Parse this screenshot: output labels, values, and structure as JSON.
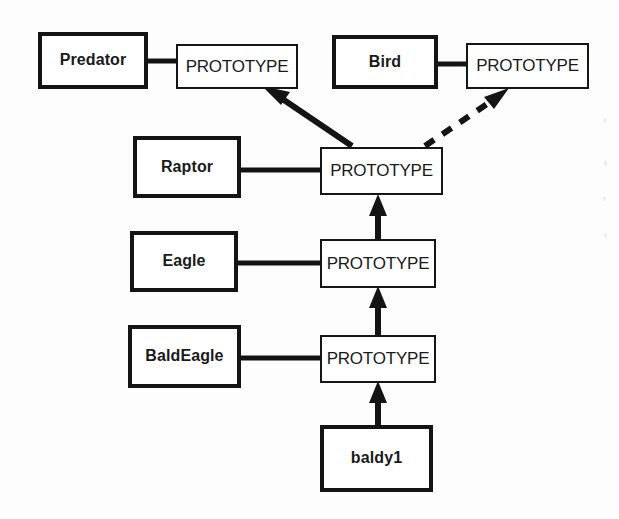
{
  "diagram": {
    "kind": "prototype-delegation-diagram",
    "title": "",
    "background_color": "#fdfdfd",
    "stroke_color": "#141414",
    "nodes": [
      {
        "id": "predator",
        "label": "Predator",
        "type": "class",
        "x": 38,
        "y": 32,
        "w": 110,
        "h": 57
      },
      {
        "id": "predator_prototype",
        "label": "PROTOTYPE",
        "type": "prototype",
        "x": 176,
        "y": 44,
        "w": 122,
        "h": 45
      },
      {
        "id": "bird",
        "label": "Bird",
        "type": "class",
        "x": 332,
        "y": 35,
        "w": 106,
        "h": 54
      },
      {
        "id": "bird_prototype",
        "label": "PROTOTYPE",
        "type": "prototype",
        "x": 466,
        "y": 43,
        "w": 123,
        "h": 46
      },
      {
        "id": "raptor",
        "label": "Raptor",
        "type": "class",
        "x": 133,
        "y": 136,
        "w": 108,
        "h": 62
      },
      {
        "id": "raptor_prototype",
        "label": "PROTOTYPE",
        "type": "prototype",
        "x": 320,
        "y": 147,
        "w": 123,
        "h": 48
      },
      {
        "id": "eagle",
        "label": "Eagle",
        "type": "class",
        "x": 130,
        "y": 231,
        "w": 108,
        "h": 61
      },
      {
        "id": "eagle_prototype",
        "label": "PROTOTYPE",
        "type": "prototype",
        "x": 320,
        "y": 239,
        "w": 116,
        "h": 49
      },
      {
        "id": "baldeagle",
        "label": "BaldEagle",
        "type": "class",
        "x": 128,
        "y": 325,
        "w": 113,
        "h": 63
      },
      {
        "id": "baldeagle_prototype",
        "label": "PROTOTYPE",
        "type": "prototype",
        "x": 320,
        "y": 335,
        "w": 116,
        "h": 48
      },
      {
        "id": "baldy1",
        "label": "baldy1",
        "type": "class",
        "x": 320,
        "y": 425,
        "w": 113,
        "h": 67
      }
    ],
    "edges": [
      {
        "id": "predator-to-prototype",
        "from": "predator",
        "to": "predator_prototype",
        "style": "solid",
        "arrow": "none",
        "kind": "link"
      },
      {
        "id": "bird-to-prototype",
        "from": "bird",
        "to": "bird_prototype",
        "style": "solid",
        "arrow": "none",
        "kind": "link"
      },
      {
        "id": "raptor-to-prototype",
        "from": "raptor",
        "to": "raptor_prototype",
        "style": "solid",
        "arrow": "none",
        "kind": "link"
      },
      {
        "id": "eagle-to-prototype",
        "from": "eagle",
        "to": "eagle_prototype",
        "style": "solid",
        "arrow": "none",
        "kind": "link"
      },
      {
        "id": "baldeagle-to-prototype",
        "from": "baldeagle",
        "to": "baldeagle_prototype",
        "style": "solid",
        "arrow": "none",
        "kind": "link"
      },
      {
        "id": "raptorproto-to-predatorproto",
        "from": "raptor_prototype",
        "to": "predator_prototype",
        "style": "solid",
        "arrow": "filled",
        "kind": "delegation"
      },
      {
        "id": "raptorproto-to-birdproto",
        "from": "raptor_prototype",
        "to": "bird_prototype",
        "style": "dashed",
        "arrow": "filled",
        "kind": "delegation"
      },
      {
        "id": "eagleproto-to-raptorproto",
        "from": "eagle_prototype",
        "to": "raptor_prototype",
        "style": "solid",
        "arrow": "filled",
        "kind": "delegation"
      },
      {
        "id": "baldeagleproto-to-eagleproto",
        "from": "baldeagle_prototype",
        "to": "eagle_prototype",
        "style": "solid",
        "arrow": "filled",
        "kind": "delegation"
      },
      {
        "id": "baldy1-to-baldeagleproto",
        "from": "baldy1",
        "to": "baldeagle_prototype",
        "style": "solid",
        "arrow": "filled",
        "kind": "delegation"
      }
    ]
  }
}
